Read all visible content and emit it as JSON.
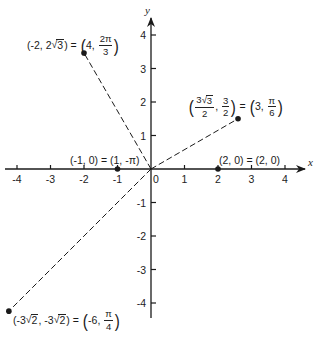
{
  "diagram": {
    "type": "polar-rectangular-coordinate-plot",
    "axes": {
      "x_label": "x",
      "y_label": "y",
      "x_ticks": [
        -4,
        -3,
        -2,
        -1,
        0,
        1,
        2,
        3,
        4
      ],
      "y_ticks": [
        -4,
        -3,
        -2,
        -1,
        1,
        2,
        3,
        4
      ],
      "x_tick_labels": [
        "-4",
        "-3",
        "-2",
        "-1",
        "0",
        "1",
        "2",
        "3",
        "4"
      ],
      "y_tick_labels": [
        "-4",
        "-3",
        "-2",
        "-1",
        "1",
        "2",
        "3",
        "4"
      ],
      "origin_label": "0"
    },
    "points": [
      {
        "id": "p1",
        "rect": [
          -2,
          3.4641
        ],
        "polar": "(4, 2π/3)",
        "label_parts": {
          "rect_x": "-2",
          "rect_y_coef": "2",
          "rect_y_rad": "3",
          "polar_r": "4",
          "polar_num": "2π",
          "polar_den": "3"
        },
        "dashed_to_origin": true
      },
      {
        "id": "p2",
        "rect": [
          2.598,
          1.5
        ],
        "polar": "(3, π/6)",
        "label_parts": {
          "rect_x_coef": "3",
          "rect_x_rad": "3",
          "rect_x_den": "2",
          "rect_y_num": "3",
          "rect_y_den": "2",
          "polar_r": "3",
          "polar_num": "π",
          "polar_den": "6"
        },
        "dashed_to_origin": true
      },
      {
        "id": "p3",
        "rect": [
          -1,
          0
        ],
        "polar": "(1, -π)",
        "label": "(-1, 0) = (1, -π)",
        "dashed_to_origin": false
      },
      {
        "id": "p4",
        "rect": [
          2,
          0
        ],
        "polar": "(2, 0)",
        "label": "(2, 0) = (2, 0)",
        "dashed_to_origin": false
      },
      {
        "id": "p5",
        "rect": [
          -4.2426,
          -4.2426
        ],
        "polar": "(-6, π/4)",
        "label_parts": {
          "rect_coef": "-3",
          "rect_rad": "2",
          "polar_r": "-6",
          "polar_num": "π",
          "polar_den": "4"
        },
        "dashed_to_origin": true
      }
    ],
    "equals": "=",
    "comma": ","
  },
  "colors": {
    "ink": "#1a1a1a",
    "background": "#ffffff"
  }
}
